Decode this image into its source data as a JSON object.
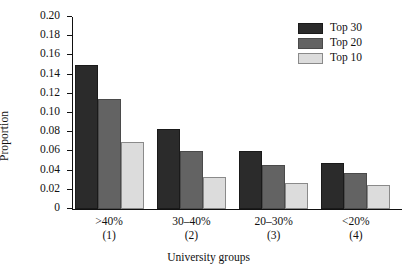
{
  "chart_data": {
    "type": "bar",
    "title": "",
    "subtitle": "",
    "xlabel": "University groups",
    "ylabel": "Proportion",
    "categories": [
      ">40%",
      "30–40%",
      "20–30%",
      "<20%"
    ],
    "category_indices": [
      "(1)",
      "(2)",
      "(3)",
      "(4)"
    ],
    "series": [
      {
        "name": "Top 30",
        "color": "#2b2b2b",
        "values": [
          0.15,
          0.083,
          0.06,
          0.048
        ]
      },
      {
        "name": "Top 20",
        "color": "#636363",
        "values": [
          0.115,
          0.06,
          0.046,
          0.037
        ]
      },
      {
        "name": "Top 10",
        "color": "#dcdcdc",
        "values": [
          0.07,
          0.033,
          0.027,
          0.025
        ]
      }
    ],
    "ylim": [
      0,
      0.2
    ],
    "ytick_labels": [
      "0.20",
      "0.18",
      "0.16",
      "0.14",
      "0.12",
      "0.10",
      "0.08",
      "0.06",
      "0.04",
      "0.02",
      "0"
    ],
    "ytick_values": [
      0.2,
      0.18,
      0.16,
      0.14,
      0.12,
      0.1,
      0.08,
      0.06,
      0.04,
      0.02,
      0
    ],
    "grid": false,
    "legend_position": "top-right",
    "bar_grouping": "clustered"
  },
  "legend": {
    "entries": [
      {
        "label": "Top 30",
        "color": "#2b2b2b"
      },
      {
        "label": "Top 20",
        "color": "#636363"
      },
      {
        "label": "Top 10",
        "color": "#dcdcdc"
      }
    ]
  },
  "axes": {
    "y_title": "Proportion",
    "x_title": "University groups"
  }
}
